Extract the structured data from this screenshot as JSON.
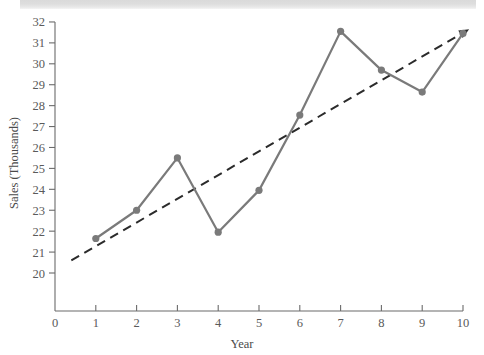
{
  "page": {
    "background_color": "#ffffff",
    "scan_banner_color": "#dcdcdc"
  },
  "chart_data": {
    "type": "line",
    "title": "",
    "subtitle": "",
    "xlabel": "Year",
    "ylabel": "Sales (Thousands)",
    "xlim": [
      0,
      10
    ],
    "ylim": [
      20,
      32
    ],
    "xticks": [
      "0",
      "1",
      "2",
      "3",
      "4",
      "5",
      "6",
      "7",
      "8",
      "9",
      "10"
    ],
    "yticks": [
      "20",
      "21",
      "22",
      "23",
      "24",
      "25",
      "26",
      "27",
      "28",
      "29",
      "30",
      "31",
      "32"
    ],
    "grid": false,
    "legend": null,
    "legend_position": "none",
    "x": [
      1,
      2,
      3,
      4,
      5,
      6,
      7,
      8,
      9,
      10
    ],
    "series": [
      {
        "name": "Sales",
        "style": "solid-with-markers",
        "color": "#7a7a7a",
        "marker": "circle",
        "values": [
          21.65,
          23.0,
          25.5,
          21.95,
          23.95,
          27.55,
          31.55,
          29.7,
          28.65,
          31.45
        ]
      },
      {
        "name": "Trend",
        "style": "dashed-with-arrow",
        "color": "#2b2b2b",
        "marker": "none",
        "x_endpoints": [
          0.4,
          10.15
        ],
        "y_endpoints": [
          20.6,
          31.65
        ]
      }
    ],
    "annotations": [
      {
        "kind": "arrowhead",
        "at_x": 10.15,
        "at_y": 31.65,
        "target": "Trend"
      }
    ]
  },
  "axes": {
    "x_axis_name": "x-axis",
    "y_axis_name": "y-axis",
    "x_title": "Year",
    "y_title": "Sales (Thousands)"
  }
}
